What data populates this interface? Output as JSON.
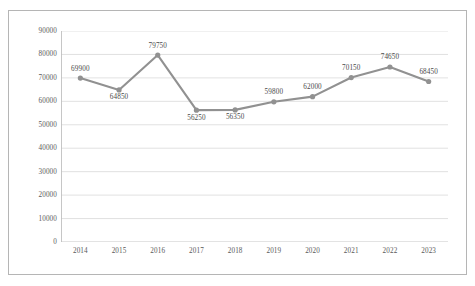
{
  "chart_data": {
    "type": "line",
    "title": "",
    "subtitle": "",
    "xlabel": "",
    "ylabel": "",
    "categories": [
      "2014",
      "2015",
      "2016",
      "2017",
      "2018",
      "2019",
      "2020",
      "2021",
      "2022",
      "2023"
    ],
    "values": [
      69900,
      64850,
      79750,
      56250,
      56350,
      59800,
      62000,
      70150,
      74650,
      68450
    ],
    "data_labels": [
      "69900",
      "64850",
      "79750",
      "56250",
      "56350",
      "59800",
      "62000",
      "70150",
      "74650",
      "68450"
    ],
    "label_positions": [
      "above",
      "below",
      "above",
      "below",
      "below",
      "above",
      "above",
      "above",
      "above",
      "above"
    ],
    "ylim": [
      0,
      90000
    ],
    "ytick_values": [
      0,
      10000,
      20000,
      30000,
      40000,
      50000,
      60000,
      70000,
      80000,
      90000
    ],
    "ytick_labels": [
      "0",
      "10000",
      "20000",
      "30000",
      "40000",
      "50000",
      "60000",
      "70000",
      "80000",
      "90000"
    ],
    "grid": true,
    "grid_axis": "y",
    "legend": false,
    "legend_position": "none",
    "series_color": "#919191",
    "marker": "circle",
    "marker_color": "#919191",
    "grid_color": "#d9d9d9",
    "axis_color": "#bfbfbf",
    "border_color": "#b5b5b5",
    "background": "#ffffff"
  }
}
